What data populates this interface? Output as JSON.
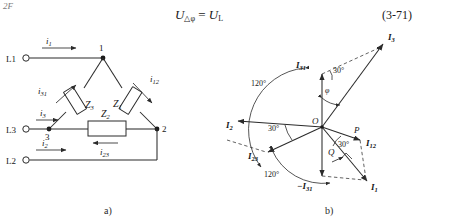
{
  "page": {
    "corner_text": "2F",
    "equation": {
      "lhs_symbol": "U",
      "lhs_sub": "△φ",
      "relation": "=",
      "rhs_symbol": "U",
      "rhs_sub": "L",
      "full_text": "U△φ = UL",
      "number": "(3-71)"
    }
  },
  "figure_a": {
    "caption": "a)",
    "title": "delta-connected three-phase load circuit",
    "terminals": [
      {
        "name": "L1",
        "label": "L1",
        "marker": "O"
      },
      {
        "name": "L3",
        "label": "L3",
        "marker": "O"
      },
      {
        "name": "L2",
        "label": "L2",
        "marker": "O"
      }
    ],
    "nodes": [
      {
        "label": "1"
      },
      {
        "label": "2"
      },
      {
        "label": "3"
      }
    ],
    "impedances": [
      {
        "name": "Z1",
        "symbol": "Z",
        "sub": "1"
      },
      {
        "name": "Z2",
        "symbol": "Z",
        "sub": "2"
      },
      {
        "name": "Z3",
        "symbol": "Z",
        "sub": "3"
      }
    ],
    "line_currents": [
      {
        "name": "i1",
        "symbol": "i",
        "sub": "1"
      },
      {
        "name": "i3",
        "symbol": "i",
        "sub": "3"
      },
      {
        "name": "i2",
        "symbol": "i",
        "sub": "2"
      }
    ],
    "phase_currents": [
      {
        "name": "i12",
        "symbol": "i",
        "sub": "12"
      },
      {
        "name": "i23",
        "symbol": "i",
        "sub": "23"
      },
      {
        "name": "i31",
        "symbol": "i",
        "sub": "31"
      }
    ]
  },
  "figure_b": {
    "caption": "b)",
    "title": "phasor diagram of delta connection",
    "origin_label": "O",
    "points": [
      {
        "name": "P",
        "label": "P"
      },
      {
        "name": "Q",
        "label": "Q"
      }
    ],
    "phasors": [
      {
        "name": "I3",
        "symbol": "I",
        "sub": "3",
        "prefix": ""
      },
      {
        "name": "I31",
        "symbol": "I",
        "sub": "31",
        "prefix": ""
      },
      {
        "name": "I2",
        "symbol": "I",
        "sub": "2",
        "prefix": ""
      },
      {
        "name": "I23",
        "symbol": "I",
        "sub": "23",
        "prefix": ""
      },
      {
        "name": "I12",
        "symbol": "I",
        "sub": "12",
        "prefix": ""
      },
      {
        "name": "I1",
        "symbol": "I",
        "sub": "1",
        "prefix": ""
      },
      {
        "name": "-I31",
        "symbol": "I",
        "sub": "31",
        "prefix": "−"
      }
    ],
    "angles": [
      {
        "name": "angle-120-upper",
        "label": "120°"
      },
      {
        "name": "angle-120-lower",
        "label": "120°"
      },
      {
        "name": "angle-30-top",
        "label": "30°"
      },
      {
        "name": "angle-30-left",
        "label": "30°"
      },
      {
        "name": "angle-30-right",
        "label": "30°"
      },
      {
        "name": "angle-phi",
        "label": "φ"
      }
    ]
  }
}
